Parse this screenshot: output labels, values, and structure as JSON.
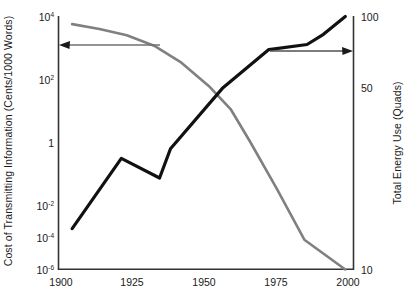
{
  "chart_data": {
    "type": "line",
    "title": "",
    "xlabel": "",
    "x_ticks": [
      "1900",
      "1925",
      "1950",
      "1975",
      "2000"
    ],
    "x_values": [
      1900,
      1925,
      1950,
      1975,
      2000
    ],
    "xlim": [
      1895,
      2003
    ],
    "grid": false,
    "legend": "none",
    "axes": [
      {
        "id": "left",
        "label": "Cost of Transmitting Information (Cents/1000 Words)",
        "scale": "log",
        "ticks": [
          "10⁴",
          "10²",
          "1",
          "10⁻²",
          "10⁻⁴",
          "10⁻⁶"
        ],
        "tick_values": [
          10000,
          100,
          1,
          0.01,
          0.0001,
          1e-06
        ],
        "ylim": [
          1e-06,
          10000
        ]
      },
      {
        "id": "right",
        "label": "Total Energy Use (Quads)",
        "scale": "log",
        "ticks": [
          "100",
          "50",
          "10"
        ],
        "tick_values": [
          100,
          50,
          10
        ],
        "ylim": [
          10,
          100
        ]
      }
    ],
    "series": [
      {
        "name": "Cost of Transmitting Information",
        "axis": "left",
        "color": "#808080",
        "width": 2.6,
        "units": "Cents/1000 Words",
        "points": [
          {
            "x": 1900,
            "y": 5000
          },
          {
            "x": 1910,
            "y": 3200
          },
          {
            "x": 1920,
            "y": 1800
          },
          {
            "x": 1930,
            "y": 700
          },
          {
            "x": 1940,
            "y": 150
          },
          {
            "x": 1950,
            "y": 18
          },
          {
            "x": 1958,
            "y": 2.2
          },
          {
            "x": 1965,
            "y": 0.12
          },
          {
            "x": 1975,
            "y": 0.0015
          },
          {
            "x": 1985,
            "y": 1.5e-05
          },
          {
            "x": 2000,
            "y": 1e-06
          }
        ]
      },
      {
        "name": "Total Energy Use",
        "axis": "right",
        "color": "#111111",
        "width": 3.2,
        "units": "Quads",
        "points": [
          {
            "x": 1900,
            "y": 14.5
          },
          {
            "x": 1918,
            "y": 27.5
          },
          {
            "x": 1932,
            "y": 23.0
          },
          {
            "x": 1936,
            "y": 30.0
          },
          {
            "x": 1955,
            "y": 52.0
          },
          {
            "x": 1972,
            "y": 74.0
          },
          {
            "x": 1986,
            "y": 77.5
          },
          {
            "x": 1992,
            "y": 85.0
          },
          {
            "x": 2000,
            "y": 100.0
          }
        ]
      }
    ],
    "annotations": [
      {
        "name": "cost-axis-arrow",
        "type": "arrow",
        "direction": "left",
        "color": "#707070",
        "from_px": [
          160,
          45
        ],
        "to_px": [
          60,
          45
        ]
      },
      {
        "name": "energy-axis-arrow",
        "type": "arrow",
        "direction": "right",
        "color": "#505050",
        "from_px": [
          270,
          51
        ],
        "to_px": [
          353,
          51
        ]
      }
    ]
  },
  "ticks": {
    "left": {
      "t0_base": "10",
      "t0_exp": "4",
      "t1_base": "10",
      "t1_exp": "2",
      "t2_base": "1",
      "t2_exp": "",
      "t3_base": "10",
      "t3_exp": "-2",
      "t4_base": "10",
      "t4_exp": "-4",
      "t5_base": "10",
      "t5_exp": "-6"
    },
    "right": {
      "t0": "100",
      "t1": "50",
      "t2": "10"
    },
    "x": {
      "t0": "1900",
      "t1": "1925",
      "t2": "1950",
      "t3": "1975",
      "t4": "2000"
    }
  },
  "labels": {
    "y_left": "Cost of Transmitting Information (Cents/1000 Words)",
    "y_right": "Total Energy Use (Quads)"
  }
}
